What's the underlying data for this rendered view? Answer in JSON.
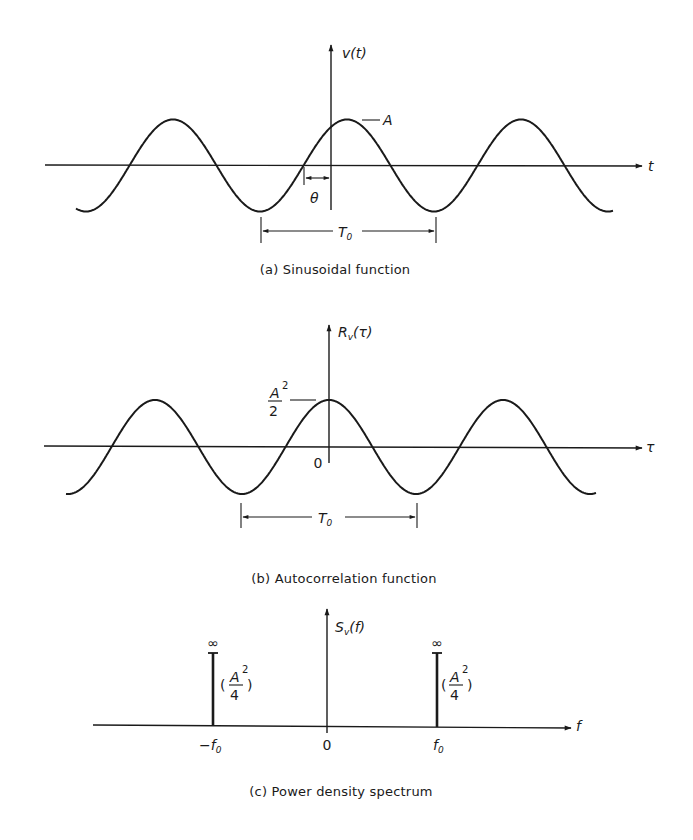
{
  "figure": {
    "panels": [
      {
        "id": "a",
        "caption": "(a) Sinusoidal function",
        "y_axis_label": "v(t)",
        "x_axis_label": "t",
        "amplitude_label": "A",
        "phase_label": "θ",
        "period_label": "T0",
        "period_label_main": "T",
        "period_label_sub": "0"
      },
      {
        "id": "b",
        "caption": "(b) Autocorrelation function",
        "y_axis_label_main": "R",
        "y_axis_label_sub": "v",
        "y_axis_label_arg": "(τ)",
        "x_axis_label": "τ",
        "origin_label": "0",
        "peak_label_num": "A",
        "peak_label_exp": "2",
        "peak_label_den": "2",
        "period_label_main": "T",
        "period_label_sub": "0"
      },
      {
        "id": "c",
        "caption": "(c) Power density spectrum",
        "y_axis_label_main": "S",
        "y_axis_label_sub": "v",
        "y_axis_label_arg": "(f)",
        "x_axis_label": "f",
        "tick_labels": [
          "-f0",
          "0",
          "f0"
        ],
        "tick_neg_main": "−f",
        "tick_pos_main": "f",
        "tick_sub": "0",
        "origin_label": "0",
        "impulse_height_label": "∞",
        "impulse_weight_num": "A",
        "impulse_weight_exp": "2",
        "impulse_weight_den": "4"
      }
    ]
  },
  "chart_data": [
    {
      "type": "line",
      "title": "(a) Sinusoidal function",
      "xlabel": "t",
      "ylabel": "v(t)",
      "function": "v(t) = A cos(2π t / T0 - θ)",
      "annotations": [
        "A (peak amplitude)",
        "θ (phase offset)",
        "T0 (period, trough to trough)"
      ],
      "periods_shown": 3.1
    },
    {
      "type": "line",
      "title": "(b) Autocorrelation function",
      "xlabel": "τ",
      "ylabel": "Rv(τ)",
      "function": "Rv(τ) = (A²/2) cos(2π τ / T0)",
      "annotations": [
        "A²/2 (peak at τ = 0)",
        "0 (origin)",
        "T0 (period)"
      ],
      "periods_shown": 3.1
    },
    {
      "type": "bar",
      "title": "(c) Power density spectrum",
      "xlabel": "f",
      "ylabel": "Sv(f)",
      "categories": [
        "-f0",
        "f0"
      ],
      "values": [
        "∞",
        "∞"
      ],
      "weights": [
        "A²/4",
        "A²/4"
      ],
      "tick_labels": [
        "-f0",
        "0",
        "f0"
      ]
    }
  ]
}
